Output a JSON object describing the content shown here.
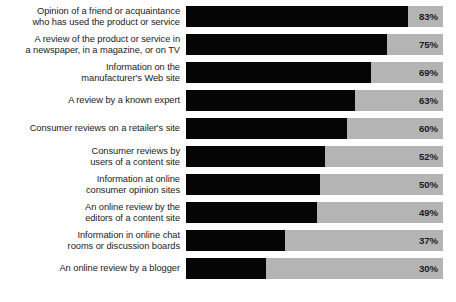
{
  "chart_data": {
    "type": "bar",
    "orientation": "horizontal",
    "title": "",
    "subtitle": "",
    "xlabel": "",
    "ylabel": "",
    "xlim": [
      0,
      100
    ],
    "grid": false,
    "legend": false,
    "value_suffix": "%",
    "track_max": 96,
    "categories": [
      "Opinion of a friend or acquaintance\nwho has used the product or service",
      "A review of the product or service in\na newspaper, in a magazine, or on TV",
      "Information on the\nmanufacturer's Web site",
      "A review by a known expert",
      "Consumer reviews on a retailer's site",
      "Consumer reviews by\nusers of a content site",
      "Information at online\nconsumer opinion sites",
      "An online review by the\neditors of a content site",
      "Information in online chat\nrooms or discussion boards",
      "An online review by a blogger"
    ],
    "values": [
      83,
      75,
      69,
      63,
      60,
      52,
      50,
      49,
      37,
      30
    ],
    "value_labels": [
      "83%",
      "75%",
      "69%",
      "63%",
      "60%",
      "52%",
      "50%",
      "49%",
      "37%",
      "30%"
    ],
    "colors": {
      "bar_fill": "#050505",
      "bar_track": "#b4b4b4",
      "label_text": "#1b1b1b",
      "background": "#ffffff"
    }
  },
  "rows": [
    {
      "label": "Opinion of a friend or acquaintance\nwho has used the product or service",
      "value": 83,
      "value_label": "83%",
      "fill_pct": "86.5%"
    },
    {
      "label": "A review of the product or service in\na newspaper, in a magazine, or on TV",
      "value": 75,
      "value_label": "75%",
      "fill_pct": "78.1%"
    },
    {
      "label": "Information on the\nmanufacturer's Web site",
      "value": 69,
      "value_label": "69%",
      "fill_pct": "71.9%"
    },
    {
      "label": "A review by a known expert",
      "value": 63,
      "value_label": "63%",
      "fill_pct": "65.6%"
    },
    {
      "label": "Consumer reviews on a retailer's site",
      "value": 60,
      "value_label": "60%",
      "fill_pct": "62.5%"
    },
    {
      "label": "Consumer reviews by\nusers of a content site",
      "value": 52,
      "value_label": "52%",
      "fill_pct": "54.2%"
    },
    {
      "label": "Information at online\nconsumer opinion sites",
      "value": 50,
      "value_label": "50%",
      "fill_pct": "52.1%"
    },
    {
      "label": "An online review by the\neditors of a content site",
      "value": 49,
      "value_label": "49%",
      "fill_pct": "51.0%"
    },
    {
      "label": "Information in online chat\nrooms or discussion boards",
      "value": 37,
      "value_label": "37%",
      "fill_pct": "38.5%"
    },
    {
      "label": "An online review by a blogger",
      "value": 30,
      "value_label": "30%",
      "fill_pct": "31.3%"
    }
  ]
}
